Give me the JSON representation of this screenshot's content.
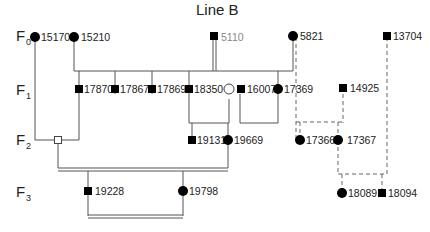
{
  "title": "Line B",
  "generations": [
    {
      "id": "F0",
      "base": "F",
      "sub": "0"
    },
    {
      "id": "F1",
      "base": "F",
      "sub": "1"
    },
    {
      "id": "F2",
      "base": "F",
      "sub": "2"
    },
    {
      "id": "F3",
      "base": "F",
      "sub": "3"
    }
  ],
  "individuals": [
    {
      "id": "15170",
      "label": "15170",
      "sex": "female",
      "filled": true,
      "generation": "F0"
    },
    {
      "id": "15210",
      "label": "15210",
      "sex": "female",
      "filled": true,
      "generation": "F0"
    },
    {
      "id": "5110",
      "label": "5110",
      "sex": "male",
      "filled": true,
      "generation": "F0",
      "label_color": "#888888"
    },
    {
      "id": "5821",
      "label": "5821",
      "sex": "female",
      "filled": true,
      "generation": "F0"
    },
    {
      "id": "13704",
      "label": "13704",
      "sex": "male",
      "filled": true,
      "generation": "F0"
    },
    {
      "id": "17870",
      "label": "17870",
      "sex": "male",
      "filled": true,
      "generation": "F1"
    },
    {
      "id": "17867",
      "label": "17867",
      "sex": "male",
      "filled": true,
      "generation": "F1"
    },
    {
      "id": "17869",
      "label": "17869",
      "sex": "male",
      "filled": true,
      "generation": "F1"
    },
    {
      "id": "18350",
      "label": "18350",
      "sex": "male",
      "filled": true,
      "generation": "F1"
    },
    {
      "id": "F1-open-female",
      "label": "",
      "sex": "female",
      "filled": false,
      "generation": "F1"
    },
    {
      "id": "16007",
      "label": "16007",
      "sex": "male",
      "filled": true,
      "generation": "F1"
    },
    {
      "id": "17369",
      "label": "17369",
      "sex": "female",
      "filled": true,
      "generation": "F1"
    },
    {
      "id": "14925",
      "label": "14925",
      "sex": "male",
      "filled": true,
      "generation": "F1"
    },
    {
      "id": "F2-open-male",
      "label": "",
      "sex": "male",
      "filled": false,
      "generation": "F2"
    },
    {
      "id": "19131",
      "label": "19131",
      "sex": "male",
      "filled": true,
      "generation": "F2"
    },
    {
      "id": "19669",
      "label": "19669",
      "sex": "female",
      "filled": true,
      "generation": "F2"
    },
    {
      "id": "17366",
      "label": "17366",
      "sex": "female",
      "filled": true,
      "generation": "F2"
    },
    {
      "id": "17367",
      "label": "17367",
      "sex": "female",
      "filled": true,
      "generation": "F2"
    },
    {
      "id": "19228",
      "label": "19228",
      "sex": "male",
      "filled": true,
      "generation": "F3"
    },
    {
      "id": "19798",
      "label": "19798",
      "sex": "female",
      "filled": true,
      "generation": "F3"
    },
    {
      "id": "18089",
      "label": "18089",
      "sex": "female",
      "filled": true,
      "generation": "F3"
    },
    {
      "id": "18094",
      "label": "18094",
      "sex": "male",
      "filled": true,
      "generation": "F3"
    }
  ],
  "legend_colors": {
    "line": "#555555",
    "dashed_line": "#666666",
    "symbol": "#000000",
    "gray_label": "#888888"
  }
}
